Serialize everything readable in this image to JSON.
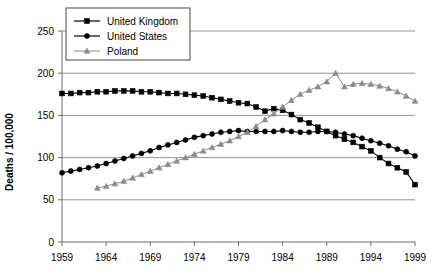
{
  "chart_data": {
    "type": "line",
    "title": "",
    "xlabel": "",
    "ylabel": "Deaths / 100,000",
    "xlim": [
      1959,
      1999
    ],
    "ylim": [
      0,
      250
    ],
    "grid": true,
    "legend_position": "top-center",
    "xticks": [
      1959,
      1964,
      1969,
      1974,
      1979,
      1984,
      1989,
      1994,
      1999
    ],
    "yticks": [
      0,
      50,
      100,
      150,
      200,
      250
    ],
    "series": [
      {
        "name": "United Kingdom",
        "color": "#000000",
        "marker": "square",
        "x": [
          1959,
          1960,
          1961,
          1962,
          1963,
          1964,
          1965,
          1966,
          1967,
          1968,
          1969,
          1970,
          1971,
          1972,
          1973,
          1974,
          1975,
          1976,
          1977,
          1978,
          1979,
          1980,
          1981,
          1982,
          1983,
          1984,
          1985,
          1986,
          1987,
          1988,
          1989,
          1990,
          1991,
          1992,
          1993,
          1994,
          1995,
          1996,
          1997,
          1998,
          1999
        ],
        "values": [
          176,
          176,
          177,
          177,
          178,
          178,
          179,
          179,
          179,
          178,
          178,
          177,
          176,
          176,
          175,
          174,
          173,
          171,
          169,
          167,
          165,
          164,
          160,
          155,
          158,
          156,
          151,
          145,
          141,
          136,
          131,
          126,
          122,
          118,
          113,
          108,
          100,
          93,
          88,
          83,
          68
        ]
      },
      {
        "name": "United States",
        "color": "#000000",
        "marker": "circle",
        "x": [
          1959,
          1960,
          1961,
          1962,
          1963,
          1964,
          1965,
          1966,
          1967,
          1968,
          1969,
          1970,
          1971,
          1972,
          1973,
          1974,
          1975,
          1976,
          1977,
          1978,
          1979,
          1980,
          1981,
          1982,
          1983,
          1984,
          1985,
          1986,
          1987,
          1988,
          1989,
          1990,
          1991,
          1992,
          1993,
          1994,
          1995,
          1996,
          1997,
          1998,
          1999
        ],
        "values": [
          82,
          84,
          86,
          88,
          90,
          93,
          96,
          99,
          102,
          105,
          108,
          112,
          115,
          118,
          121,
          124,
          126,
          128,
          130,
          131,
          132,
          131,
          131,
          131,
          131,
          132,
          131,
          130,
          130,
          131,
          131,
          130,
          128,
          126,
          123,
          120,
          117,
          114,
          110,
          107,
          102
        ]
      },
      {
        "name": "Poland",
        "color": "#8c8c8c",
        "marker": "triangle",
        "x": [
          1963,
          1964,
          1965,
          1966,
          1967,
          1968,
          1969,
          1970,
          1971,
          1972,
          1973,
          1974,
          1975,
          1976,
          1977,
          1978,
          1979,
          1980,
          1981,
          1982,
          1983,
          1984,
          1985,
          1986,
          1987,
          1988,
          1989,
          1990,
          1991,
          1992,
          1993,
          1994,
          1995,
          1996,
          1997,
          1998,
          1999
        ],
        "values": [
          64,
          66,
          69,
          72,
          76,
          80,
          84,
          88,
          92,
          96,
          100,
          104,
          108,
          112,
          116,
          120,
          125,
          130,
          137,
          145,
          152,
          160,
          168,
          175,
          180,
          184,
          190,
          200,
          184,
          187,
          188,
          187,
          185,
          182,
          178,
          173,
          167
        ]
      }
    ]
  },
  "axis": {
    "y_label": "Deaths / 100,000",
    "y_ticks": [
      "250",
      "200",
      "150",
      "100",
      "50",
      "0"
    ],
    "x_ticks": [
      "1959",
      "1964",
      "1969",
      "1974",
      "1979",
      "1984",
      "1989",
      "1994",
      "1999"
    ]
  },
  "legend": {
    "entries": [
      {
        "label": "United Kingdom",
        "marker": "square-marker",
        "color": "#000000"
      },
      {
        "label": "United States",
        "marker": "circle-marker",
        "color": "#000000"
      },
      {
        "label": "Poland",
        "marker": "triangle-marker",
        "color": "#8c8c8c"
      }
    ]
  }
}
